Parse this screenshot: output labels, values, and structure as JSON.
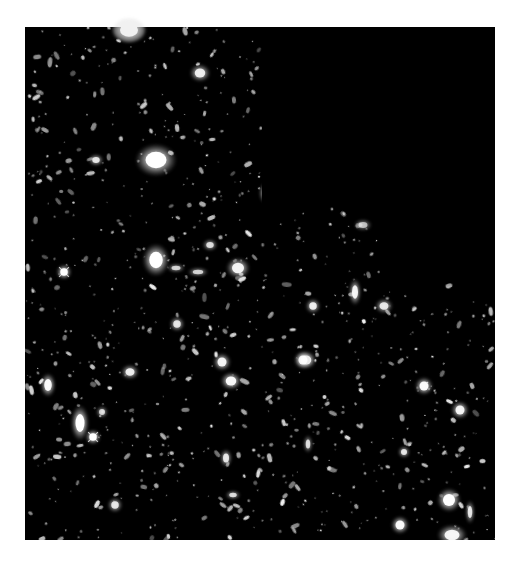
{
  "image": {
    "title": "Deep field astronomical image",
    "background": "#ffffff",
    "field_color": "#000000",
    "field_outline": [
      [
        25,
        27
      ],
      [
        495,
        27
      ],
      [
        495,
        540
      ],
      [
        25,
        540
      ]
    ],
    "empty_region": {
      "color": "#000000",
      "polygon": [
        [
          262,
          27
        ],
        [
          495,
          27
        ],
        [
          495,
          281
        ],
        [
          380,
          281
        ],
        [
          380,
          205
        ],
        [
          262,
          205
        ]
      ]
    }
  },
  "bright_objects": [
    {
      "name": "bright-star-top",
      "x": 129,
      "y": 30,
      "rx": 12,
      "ry": 9,
      "b": 1.0,
      "spikes": false
    },
    {
      "name": "galaxy-top-mid",
      "x": 200,
      "y": 73,
      "rx": 7,
      "ry": 6,
      "b": 0.85,
      "spikes": false
    },
    {
      "name": "galaxy-large-upper",
      "x": 156,
      "y": 160,
      "rx": 14,
      "ry": 11,
      "b": 1.0,
      "spikes": false
    },
    {
      "name": "galaxy-small-upper",
      "x": 96,
      "y": 160,
      "rx": 5,
      "ry": 4,
      "b": 0.8,
      "spikes": false
    },
    {
      "name": "galaxy-elong-upper",
      "x": 265,
      "y": 193,
      "rx": 4,
      "ry": 7,
      "b": 0.8,
      "spikes": false
    },
    {
      "name": "galaxy-irregular",
      "x": 363,
      "y": 225,
      "rx": 6,
      "ry": 4,
      "b": 0.6,
      "spikes": false
    },
    {
      "name": "star-spiked-left",
      "x": 64,
      "y": 272,
      "rx": 5,
      "ry": 5,
      "b": 1.0,
      "spikes": true
    },
    {
      "name": "galaxy-oval-mid",
      "x": 156,
      "y": 260,
      "rx": 9,
      "ry": 11,
      "b": 1.0,
      "spikes": false
    },
    {
      "name": "galaxy-mid-right",
      "x": 238,
      "y": 268,
      "rx": 8,
      "ry": 7,
      "b": 0.9,
      "spikes": false
    },
    {
      "name": "galaxy-pair-a",
      "x": 198,
      "y": 272,
      "rx": 7,
      "ry": 3,
      "b": 0.7,
      "spikes": false
    },
    {
      "name": "galaxy-pair-b",
      "x": 176,
      "y": 268,
      "rx": 6,
      "ry": 3,
      "b": 0.7,
      "spikes": false
    },
    {
      "name": "galaxy-top-right-cluster",
      "x": 210,
      "y": 245,
      "rx": 5,
      "ry": 4,
      "b": 0.75,
      "spikes": false
    },
    {
      "name": "galaxy-vertical",
      "x": 355,
      "y": 292,
      "rx": 4,
      "ry": 9,
      "b": 0.9,
      "spikes": false
    },
    {
      "name": "galaxy-right-a",
      "x": 384,
      "y": 306,
      "rx": 6,
      "ry": 5,
      "b": 0.8,
      "spikes": false
    },
    {
      "name": "galaxy-left-a",
      "x": 48,
      "y": 385,
      "rx": 5,
      "ry": 8,
      "b": 0.95,
      "spikes": false
    },
    {
      "name": "galaxy-left-b",
      "x": 130,
      "y": 372,
      "rx": 6,
      "ry": 5,
      "b": 0.85,
      "spikes": false
    },
    {
      "name": "galaxy-elong-bright",
      "x": 80,
      "y": 423,
      "rx": 6,
      "ry": 12,
      "b": 1.0,
      "spikes": false
    },
    {
      "name": "star-spiked-bottom-left",
      "x": 93,
      "y": 437,
      "rx": 5,
      "ry": 5,
      "b": 1.0,
      "spikes": true
    },
    {
      "name": "galaxy-left-c",
      "x": 102,
      "y": 412,
      "rx": 4,
      "ry": 4,
      "b": 0.7,
      "spikes": false
    },
    {
      "name": "galaxy-center-a",
      "x": 222,
      "y": 362,
      "rx": 6,
      "ry": 6,
      "b": 0.9,
      "spikes": false
    },
    {
      "name": "galaxy-center-b",
      "x": 231,
      "y": 381,
      "rx": 7,
      "ry": 6,
      "b": 0.95,
      "spikes": false
    },
    {
      "name": "galaxy-center-c",
      "x": 306,
      "y": 360,
      "rx": 7,
      "ry": 6,
      "b": 0.95,
      "spikes": false
    },
    {
      "name": "galaxy-center-d",
      "x": 313,
      "y": 306,
      "rx": 5,
      "ry": 5,
      "b": 0.85,
      "spikes": false
    },
    {
      "name": "galaxy-center-e",
      "x": 177,
      "y": 324,
      "rx": 5,
      "ry": 5,
      "b": 0.8,
      "spikes": false
    },
    {
      "name": "galaxy-center-f",
      "x": 303,
      "y": 360,
      "rx": 6,
      "ry": 6,
      "b": 0.9,
      "spikes": false
    },
    {
      "name": "galaxy-lower-right-a",
      "x": 424,
      "y": 386,
      "rx": 6,
      "ry": 6,
      "b": 0.95,
      "spikes": false
    },
    {
      "name": "galaxy-lower-right-b",
      "x": 460,
      "y": 410,
      "rx": 6,
      "ry": 6,
      "b": 0.9,
      "spikes": false
    },
    {
      "name": "galaxy-lower-right-c",
      "x": 449,
      "y": 500,
      "rx": 8,
      "ry": 8,
      "b": 1.0,
      "spikes": false
    },
    {
      "name": "galaxy-lower-right-d",
      "x": 400,
      "y": 525,
      "rx": 6,
      "ry": 6,
      "b": 0.95,
      "spikes": false
    },
    {
      "name": "galaxy-lower-right-e",
      "x": 452,
      "y": 535,
      "rx": 10,
      "ry": 7,
      "b": 0.9,
      "spikes": false
    },
    {
      "name": "galaxy-lower-right-f",
      "x": 404,
      "y": 452,
      "rx": 4,
      "ry": 4,
      "b": 0.8,
      "spikes": false
    },
    {
      "name": "galaxy-bottom-a",
      "x": 115,
      "y": 505,
      "rx": 5,
      "ry": 5,
      "b": 0.8,
      "spikes": false
    },
    {
      "name": "galaxy-bottom-b",
      "x": 233,
      "y": 495,
      "rx": 5,
      "ry": 3,
      "b": 0.75,
      "spikes": false
    },
    {
      "name": "galaxy-bottom-c",
      "x": 308,
      "y": 444,
      "rx": 3,
      "ry": 6,
      "b": 0.75,
      "spikes": false
    },
    {
      "name": "galaxy-bottom-d",
      "x": 226,
      "y": 458,
      "rx": 4,
      "ry": 6,
      "b": 0.8,
      "spikes": false
    },
    {
      "name": "galaxy-right-edge",
      "x": 470,
      "y": 512,
      "rx": 3,
      "ry": 8,
      "b": 0.8,
      "spikes": false
    }
  ],
  "faint_field": {
    "count": 900,
    "seed": 7,
    "min_radius": 0.6,
    "max_radius": 2.4
  }
}
